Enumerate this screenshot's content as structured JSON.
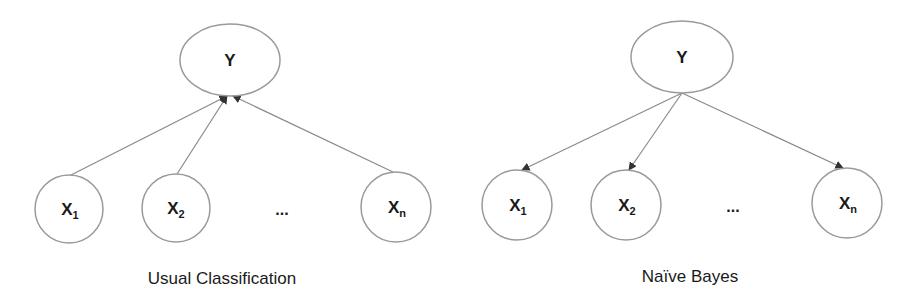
{
  "diagrams": [
    {
      "caption": "Usual Classification",
      "direction": "features-to-class",
      "class_node": {
        "label": "Y"
      },
      "feature_nodes": [
        {
          "base": "X",
          "sub": "1"
        },
        {
          "base": "X",
          "sub": "2"
        },
        {
          "base": "X",
          "sub": "n"
        }
      ],
      "ellipsis": "..."
    },
    {
      "caption": "Naïve Bayes",
      "direction": "class-to-features",
      "class_node": {
        "label": "Y"
      },
      "feature_nodes": [
        {
          "base": "X",
          "sub": "1"
        },
        {
          "base": "X",
          "sub": "2"
        },
        {
          "base": "X",
          "sub": "n"
        }
      ],
      "ellipsis": "..."
    }
  ],
  "colors": {
    "node_stroke": "#9a9a9a",
    "edge": "#8a8a8a",
    "arrowhead": "#333333",
    "text": "#1a1a1a",
    "background": "#ffffff"
  }
}
